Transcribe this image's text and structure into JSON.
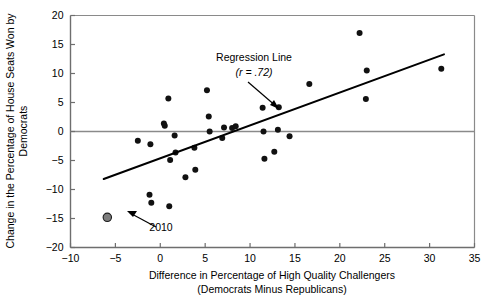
{
  "chart_data": {
    "type": "scatter",
    "title": "",
    "xlabel": "Difference in Percentage of High Quality Challengers",
    "xlabel_line2": "(Democrats Minus Republicans)",
    "ylabel": "Change in the Percentage of House Seats Won by",
    "ylabel_line2": "Democrats",
    "xlim": [
      -10,
      35
    ],
    "ylim": [
      -20,
      20
    ],
    "xticks": [
      -10,
      -5,
      0,
      5,
      10,
      15,
      20,
      25,
      30,
      35
    ],
    "xtick_labels": [
      "−10",
      "−5",
      "0",
      "5",
      "10",
      "15",
      "20",
      "25",
      "30",
      "35"
    ],
    "yticks": [
      -20,
      -15,
      -10,
      -5,
      0,
      5,
      10,
      15,
      20
    ],
    "ytick_labels": [
      "−20",
      "−15",
      "−10",
      "−5",
      "0",
      "5",
      "10",
      "15",
      "20"
    ],
    "grid": false,
    "legend": false,
    "zero_line_y": 0,
    "marker_color": "#111111",
    "highlight_color": "#7d7d7d",
    "points": [
      {
        "x": -5.9,
        "y": -14.8,
        "label": "2010",
        "highlight": true
      },
      {
        "x": -2.5,
        "y": -1.6,
        "highlight": false
      },
      {
        "x": -1.2,
        "y": -10.9,
        "highlight": false
      },
      {
        "x": -1.1,
        "y": -2.2,
        "highlight": false
      },
      {
        "x": -1.0,
        "y": -12.3,
        "highlight": false
      },
      {
        "x": 0.4,
        "y": 1.4,
        "highlight": false
      },
      {
        "x": 0.5,
        "y": 1.0,
        "highlight": false
      },
      {
        "x": 0.9,
        "y": 5.7,
        "highlight": false
      },
      {
        "x": 1.0,
        "y": -12.9,
        "highlight": false
      },
      {
        "x": 1.1,
        "y": -4.9,
        "highlight": false
      },
      {
        "x": 1.6,
        "y": -0.7,
        "highlight": false
      },
      {
        "x": 1.7,
        "y": -3.6,
        "highlight": false
      },
      {
        "x": 2.8,
        "y": -7.9,
        "highlight": false
      },
      {
        "x": 3.8,
        "y": -2.8,
        "highlight": false
      },
      {
        "x": 3.9,
        "y": -6.6,
        "highlight": false
      },
      {
        "x": 5.2,
        "y": 7.1,
        "highlight": false
      },
      {
        "x": 5.4,
        "y": 2.6,
        "highlight": false
      },
      {
        "x": 5.5,
        "y": 0.0,
        "highlight": false
      },
      {
        "x": 6.9,
        "y": -1.1,
        "highlight": false
      },
      {
        "x": 7.1,
        "y": 0.7,
        "highlight": false
      },
      {
        "x": 8.0,
        "y": 0.6,
        "highlight": false
      },
      {
        "x": 8.4,
        "y": 0.9,
        "highlight": false
      },
      {
        "x": 11.4,
        "y": 4.1,
        "highlight": false
      },
      {
        "x": 11.5,
        "y": 0.0,
        "highlight": false
      },
      {
        "x": 11.6,
        "y": -4.7,
        "highlight": false
      },
      {
        "x": 12.7,
        "y": -3.5,
        "highlight": false
      },
      {
        "x": 13.1,
        "y": 0.3,
        "highlight": false
      },
      {
        "x": 13.2,
        "y": 4.2,
        "highlight": false
      },
      {
        "x": 14.4,
        "y": -0.8,
        "highlight": false
      },
      {
        "x": 16.6,
        "y": 8.2,
        "highlight": false
      },
      {
        "x": 22.2,
        "y": 17.0,
        "highlight": false
      },
      {
        "x": 22.9,
        "y": 5.6,
        "highlight": false
      },
      {
        "x": 23.0,
        "y": 10.5,
        "highlight": false
      },
      {
        "x": 31.3,
        "y": 10.8,
        "highlight": false
      }
    ],
    "regression_line": {
      "label": "Regression Line",
      "r_label": "(r = .72)",
      "r_value": 0.72,
      "x_start": -6.3,
      "y_start": -8.2,
      "x_end": 31.6,
      "y_end": 13.3
    },
    "annotations": [
      {
        "name": "regression-annotation",
        "text": "Regression Line",
        "subtext": "(r = .72)"
      },
      {
        "name": "year-annotation",
        "text": "2010"
      }
    ]
  }
}
